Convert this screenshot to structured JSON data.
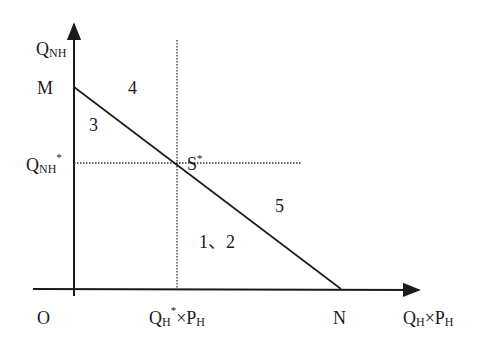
{
  "diagram": {
    "type": "economic-region-diagram",
    "colors": {
      "ink": "#1a1a1a",
      "background": "#ffffff"
    },
    "axes": {
      "y_label": {
        "main": "Q",
        "sub": "NH"
      },
      "x_label": {
        "main": "Q",
        "sub": "H",
        "times": "×",
        "main2": "P",
        "sub2": "H"
      },
      "origin": "O"
    },
    "points": {
      "M": "M",
      "N": "N",
      "S": {
        "main": "S",
        "sup": "*"
      }
    },
    "ticks": {
      "y_star": {
        "main": "Q",
        "sub": "NH",
        "sup": "*"
      },
      "x_star": {
        "main": "Q",
        "sub": "H",
        "sup": "*",
        "times": "×",
        "main2": "P",
        "sub2": "H"
      }
    },
    "regions": {
      "r3": "3",
      "r4": "4",
      "r5": "5",
      "r12": "1、2"
    },
    "lines": {
      "budget_line": "M to N, solid",
      "guides": "dotted lines through S*"
    }
  }
}
